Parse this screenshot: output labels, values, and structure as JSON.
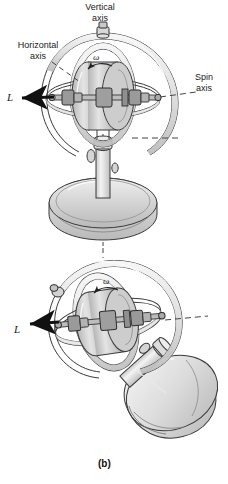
{
  "figure": {
    "caption": "(b)",
    "background_color": "#ffffff",
    "ink_color": "#1a1a1a",
    "metal_fill": "#d9d9d9",
    "metal_fill_light": "#ececec",
    "metal_fill_dark": "#b8b8b8"
  },
  "labels": {
    "vertical_axis": "Vertical\naxis",
    "horizontal_axis": "Horizontal\naxis",
    "spin_axis": "Spin\naxis",
    "angular_momentum_top": "L",
    "angular_momentum_bottom": "L",
    "omega_top": "ω",
    "omega_bottom": "ω"
  },
  "diagrams": [
    {
      "name": "upright-gyroscope",
      "state": "level",
      "parts": [
        "outer-gimbal-ring",
        "inner-gimbal-ring",
        "flywheel-rotor",
        "spin-axle",
        "support-post",
        "pedestal-base"
      ],
      "vectors": [
        {
          "name": "angular-momentum",
          "label": "L",
          "direction": "left-horizontal"
        },
        {
          "name": "spin-angular-velocity",
          "label": "ω",
          "direction": "counterclockwise"
        }
      ],
      "axes": [
        "Vertical axis",
        "Horizontal axis",
        "Spin axis"
      ]
    },
    {
      "name": "tilted-gyroscope",
      "state": "tilted-precessing",
      "parts": [
        "outer-gimbal-ring",
        "inner-gimbal-ring",
        "flywheel-rotor",
        "spin-axle",
        "support-post",
        "pedestal-base"
      ],
      "vectors": [
        {
          "name": "angular-momentum",
          "label": "L",
          "direction": "left-horizontal"
        },
        {
          "name": "spin-angular-velocity",
          "label": "ω",
          "direction": "counterclockwise"
        }
      ]
    }
  ]
}
